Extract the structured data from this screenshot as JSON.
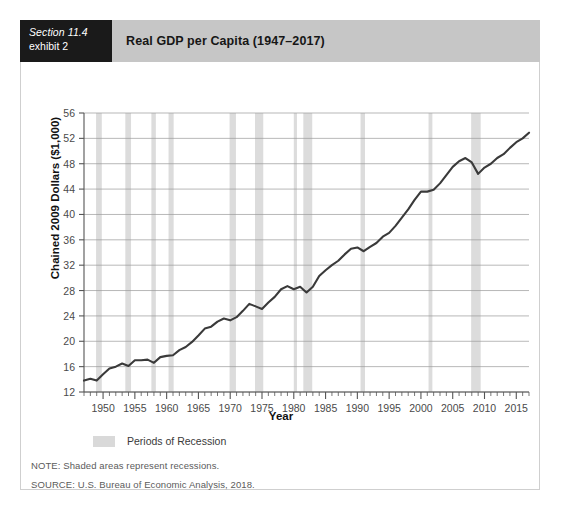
{
  "exhibit": {
    "section_label": "Section 11.4",
    "exhibit_label": "exhibit 2",
    "title": "Real GDP per Capita (1947–2017)"
  },
  "legend": {
    "swatch_color": "#d9d9d9",
    "label": "Periods of Recession"
  },
  "footnotes": {
    "note": "NOTE: Shaded areas represent recessions.",
    "source": "SOURCE: U.S. Bureau of Economic Analysis, 2018."
  },
  "chart_data": {
    "type": "line",
    "title": "Real GDP per Capita (1947–2017)",
    "xlabel": "Year",
    "ylabel": "Chained 2009 Dollars ($1,000)",
    "xlim": [
      1947,
      2017
    ],
    "ylim": [
      12,
      56
    ],
    "ytick_step": 4,
    "yticks": [
      12,
      16,
      20,
      24,
      28,
      32,
      36,
      40,
      44,
      48,
      52,
      56
    ],
    "xticks": [
      1950,
      1955,
      1960,
      1965,
      1970,
      1975,
      1980,
      1985,
      1990,
      1995,
      2000,
      2005,
      2010,
      2015
    ],
    "xtick_minor_step": 1,
    "grid": "horizontal",
    "legend_position": "below-axis-left",
    "line_color": "#3a3a3a",
    "line_width": 2.1,
    "grid_color": "#9a9a9a",
    "axis_color": "#6a6a6a",
    "series": [
      {
        "name": "Real GDP per Capita",
        "x": [
          1947,
          1948,
          1949,
          1950,
          1951,
          1952,
          1953,
          1954,
          1955,
          1956,
          1957,
          1958,
          1959,
          1960,
          1961,
          1962,
          1963,
          1964,
          1965,
          1966,
          1967,
          1968,
          1969,
          1970,
          1971,
          1972,
          1973,
          1974,
          1975,
          1976,
          1977,
          1978,
          1979,
          1980,
          1981,
          1982,
          1983,
          1984,
          1985,
          1986,
          1987,
          1988,
          1989,
          1990,
          1991,
          1992,
          1993,
          1994,
          1995,
          1996,
          1997,
          1998,
          1999,
          2000,
          2001,
          2002,
          2003,
          2004,
          2005,
          2006,
          2007,
          2008,
          2009,
          2010,
          2011,
          2012,
          2013,
          2014,
          2015,
          2016,
          2017
        ],
        "values": [
          13.8,
          14.1,
          13.8,
          14.8,
          15.7,
          16.0,
          16.5,
          16.1,
          17.0,
          17.0,
          17.1,
          16.6,
          17.5,
          17.7,
          17.8,
          18.6,
          19.1,
          19.9,
          20.9,
          22.0,
          22.3,
          23.1,
          23.6,
          23.3,
          23.8,
          24.8,
          25.9,
          25.5,
          25.1,
          26.1,
          27.0,
          28.2,
          28.7,
          28.2,
          28.6,
          27.7,
          28.6,
          30.3,
          31.2,
          32.0,
          32.7,
          33.7,
          34.6,
          34.8,
          34.2,
          34.9,
          35.5,
          36.5,
          37.1,
          38.2,
          39.5,
          40.8,
          42.3,
          43.6,
          43.6,
          43.9,
          44.9,
          46.2,
          47.5,
          48.4,
          48.9,
          48.2,
          46.4,
          47.4,
          48.0,
          48.9,
          49.5,
          50.5,
          51.4,
          52.0,
          52.9
        ]
      }
    ],
    "recessions": [
      {
        "start": 1948.9,
        "end": 1949.8
      },
      {
        "start": 1953.5,
        "end": 1954.4
      },
      {
        "start": 1957.6,
        "end": 1958.3
      },
      {
        "start": 1960.3,
        "end": 1961.1
      },
      {
        "start": 1969.9,
        "end": 1970.9
      },
      {
        "start": 1973.9,
        "end": 1975.2
      },
      {
        "start": 1980.0,
        "end": 1980.5
      },
      {
        "start": 1981.5,
        "end": 1982.9
      },
      {
        "start": 1990.5,
        "end": 1991.2
      },
      {
        "start": 2001.2,
        "end": 2001.8
      },
      {
        "start": 2007.9,
        "end": 2009.4
      }
    ],
    "recession_band_color": "#dcdcdc"
  }
}
